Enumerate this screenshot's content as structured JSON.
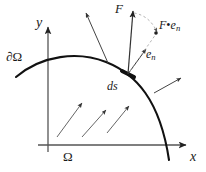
{
  "figure": {
    "colors": {
      "ink": "#1a1a1a",
      "axis": "#555555",
      "curve": "#111111",
      "arrow": "#333333",
      "dashed": "#999999",
      "background": "#ffffff"
    },
    "axes": {
      "x_label": "x",
      "y_label": "y",
      "origin": {
        "x": 48,
        "y": 145
      }
    },
    "labels": {
      "domain": "Ω",
      "boundary": "∂Ω",
      "surface_element": "ds",
      "field_vector": "F",
      "normal_vector_base": "e",
      "normal_vector_sub": "n",
      "projection_base": "F",
      "projection_dot": "•",
      "projection_vec": "e",
      "projection_sub": "n"
    },
    "vectors": {
      "interior": [
        {
          "name": "interior-arrow-1",
          "x1": 57,
          "y1": 137,
          "x2": 82,
          "y2": 103
        },
        {
          "name": "interior-arrow-2",
          "x1": 82,
          "y1": 137,
          "x2": 106,
          "y2": 110
        },
        {
          "name": "interior-arrow-3",
          "x1": 107,
          "y1": 133,
          "x2": 129,
          "y2": 106
        },
        {
          "name": "exterior-arrow-left",
          "x1": 106,
          "y1": 62,
          "x2": 86,
          "y2": 13
        },
        {
          "name": "exterior-arrow-right",
          "x1": 155,
          "y1": 92,
          "x2": 181,
          "y2": 78
        }
      ],
      "field": {
        "name": "F-vector",
        "x1": 128,
        "y1": 74,
        "x2": 133,
        "y2": 11
      },
      "normal": {
        "name": "en-normal-vector",
        "x1": 128,
        "y1": 74,
        "x2": 146,
        "y2": 48
      },
      "projection": {
        "name": "projection-vector",
        "x1": 128,
        "y1": 74,
        "x2": 156,
        "y2": 33
      }
    }
  }
}
